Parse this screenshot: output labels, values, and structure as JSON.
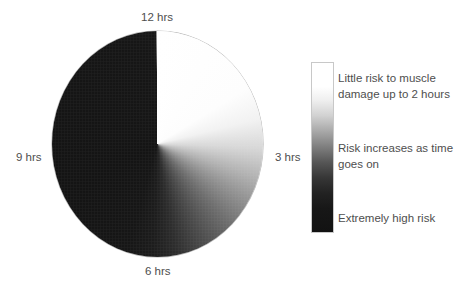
{
  "figure": {
    "title": "",
    "type": "clock-risk-diagram"
  },
  "chart_data": {
    "type": "pie",
    "title": "",
    "subtitle": "",
    "xlabel": "",
    "ylabel": "",
    "categories": [
      "12 hrs",
      "3 hrs",
      "6 hrs",
      "9 hrs"
    ],
    "values": [
      25,
      25,
      25,
      25
    ],
    "gradient": {
      "kind": "conic",
      "start_angle_deg": 0,
      "direction": "clockwise",
      "from_color": "#ffffff",
      "to_color": "#141414"
    },
    "legend_position": "right",
    "grid": false
  },
  "clock": {
    "labels": [
      {
        "id": "12",
        "text": "12 hrs",
        "angle_deg": 0
      },
      {
        "id": "3",
        "text": "3 hrs",
        "angle_deg": 90
      },
      {
        "id": "6",
        "text": "6 hrs",
        "angle_deg": 180
      },
      {
        "id": "9",
        "text": "9 hrs",
        "angle_deg": 270
      }
    ]
  },
  "legend": {
    "colorbar": {
      "orientation": "vertical",
      "top_color": "#ffffff",
      "bottom_color": "#121212"
    },
    "entries": [
      {
        "text": "Little risk to muscle damage up to 2 hours"
      },
      {
        "text": "Risk increases as time goes on"
      },
      {
        "text": "Extremely high risk"
      }
    ]
  },
  "colors": {
    "background": "#ffffff",
    "text": "#4e4e4e",
    "low_risk": "#ffffff",
    "high_risk": "#141414"
  }
}
